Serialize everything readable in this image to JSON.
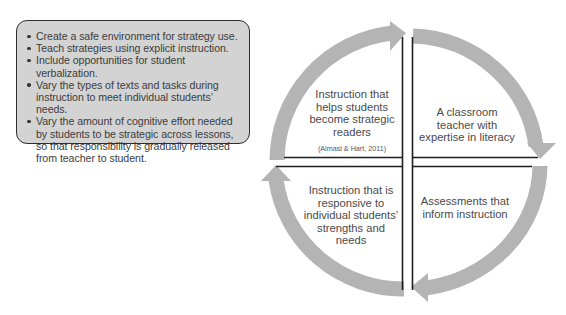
{
  "principles_box": {
    "items": [
      "Create a safe environment for strategy use.",
      "Teach strategies using explicit instruction.",
      "Include opportunities for student verbalization.",
      "Vary the types of texts and tasks during instruction to meet individual students’ needs.",
      "Vary the amount of cognitive effort needed by students to be strategic across lessons, so that responsibility is gradually released from teacher to student."
    ]
  },
  "cycle": {
    "quadrants": {
      "top_left": {
        "label": "Instruction that helps students become strategic readers",
        "citation": "(Almasi & Hart, 2011)"
      },
      "top_right": {
        "label": "A classroom teacher with expertise in literacy"
      },
      "bottom_right": {
        "label": "Assessments that inform instruction"
      },
      "bottom_left": {
        "label": "Instruction that is responsive to individual students’ strengths and needs"
      }
    },
    "arrow_direction": "clockwise",
    "colors": {
      "arrow": "#b4b4b4",
      "lines": "#1e1e1e",
      "box_fill": "#d3d3d3"
    }
  }
}
